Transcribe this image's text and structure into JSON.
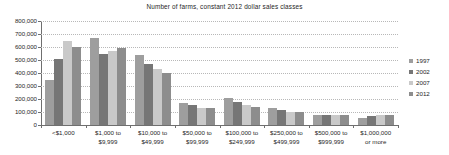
{
  "chart_data": {
    "type": "bar",
    "title": "Number of farms, constant 2012 dollar sales classes",
    "xlabel": "",
    "ylabel": "",
    "ylim": [
      0,
      800000
    ],
    "yticks": [
      0,
      100000,
      200000,
      300000,
      400000,
      500000,
      600000,
      700000,
      800000
    ],
    "ytick_labels": [
      "0",
      "100,000",
      "200,000",
      "300,000",
      "400,000",
      "500,000",
      "600,000",
      "700,000",
      "800,000"
    ],
    "grid": true,
    "legend_position": "right",
    "categories": [
      "<$1,000",
      "$1,000 to\n$9,999",
      "$10,000 to\n$49,999",
      "$50,000 to\n$99,999",
      "$100,000 to\n$249,999",
      "$250,000 to\n$499,999",
      "$500,000 to\n$999,999",
      "$1,000,000\nor more"
    ],
    "series": [
      {
        "name": "1997",
        "color": "#9e9e9e",
        "values": [
          348000,
          672000,
          540000,
          172000,
          210000,
          132000,
          80000,
          57000
        ]
      },
      {
        "name": "2002",
        "color": "#767676",
        "values": [
          511000,
          549000,
          470000,
          155000,
          178000,
          118000,
          80000,
          70000
        ]
      },
      {
        "name": "2007",
        "color": "#c9c9c9",
        "values": [
          645000,
          573000,
          430000,
          133000,
          152000,
          100000,
          79000,
          78000
        ]
      },
      {
        "name": "2012",
        "color": "#8d8d8d",
        "values": [
          601000,
          594000,
          400000,
          130000,
          140000,
          97000,
          78000,
          80000
        ]
      }
    ]
  }
}
